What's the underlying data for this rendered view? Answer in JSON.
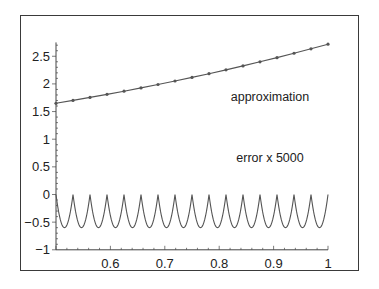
{
  "chart_data": {
    "type": "line",
    "title": "",
    "xlabel": "",
    "ylabel": "",
    "xlim": [
      0.5,
      1.0
    ],
    "ylim": [
      -1,
      2.75
    ],
    "grid": false,
    "legend": "none",
    "x_ticks": [
      {
        "value": 0.6,
        "label": "0.6"
      },
      {
        "value": 0.7,
        "label": "0.7"
      },
      {
        "value": 0.8,
        "label": "0.8"
      },
      {
        "value": 0.9,
        "label": "0.9"
      },
      {
        "value": 1.0,
        "label": "1"
      }
    ],
    "y_ticks": [
      {
        "value": 2.5,
        "label": "2.5"
      },
      {
        "value": 2.0,
        "label": "2"
      },
      {
        "value": 1.5,
        "label": "1.5"
      },
      {
        "value": 1.0,
        "label": "1"
      },
      {
        "value": 0.5,
        "label": "0.5"
      },
      {
        "value": 0.0,
        "label": "0"
      },
      {
        "value": -0.5,
        "label": "−0.5"
      },
      {
        "value": -1.0,
        "label": "−1"
      }
    ],
    "annotations": [
      {
        "text": "approximation",
        "x": 0.89,
        "y": 1.72
      },
      {
        "text": "error x 5000",
        "x": 0.89,
        "y": 0.62
      }
    ],
    "series": [
      {
        "name": "approximation",
        "style": "line with point markers",
        "x": [
          0.5,
          0.53125,
          0.5625,
          0.59375,
          0.625,
          0.65625,
          0.6875,
          0.71875,
          0.75,
          0.78125,
          0.8125,
          0.84375,
          0.875,
          0.90625,
          0.9375,
          0.96875,
          1.0
        ],
        "values": [
          1.649,
          1.701,
          1.755,
          1.811,
          1.868,
          1.927,
          1.989,
          2.052,
          2.117,
          2.184,
          2.254,
          2.325,
          2.399,
          2.475,
          2.554,
          2.635,
          2.718
        ]
      },
      {
        "name": "error x 5000",
        "style": "line",
        "description": "16 scalloped arches: zero at each node x = 0.5 + k/32, minimum about -0.6 at each interval midpoint",
        "node_value": 0.0,
        "midpoint_min": -0.6,
        "intervals": 16
      }
    ]
  },
  "labels": {
    "annotation_approx": "approximation",
    "annotation_error": "error x 5000"
  }
}
